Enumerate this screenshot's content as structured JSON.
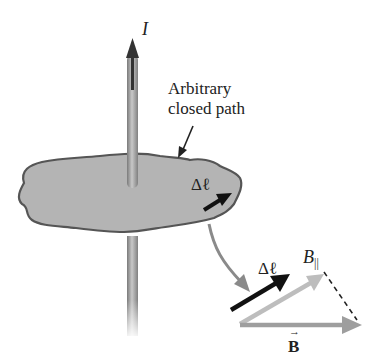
{
  "diagram": {
    "labels": {
      "current": "I",
      "path_line1": "Arbitrary",
      "path_line2": "closed path",
      "dl_on_path": "Δℓ",
      "dl_vector": "Δℓ",
      "b_parallel": "B",
      "b_parallel_sub": "||",
      "b_vector": "B",
      "b_vector_arrow": "→"
    },
    "colors": {
      "background": "#ffffff",
      "surface_fill": "#b4b4b4",
      "surface_outline": "#555555",
      "wire": "#9a9a9a",
      "current_arrow": "#333333",
      "dl_arrow": "#111111",
      "b_parallel_arrow": "#bdbdbd",
      "b_arrow": "#9e9e9e",
      "pointer_arrow": "#8a8a8a"
    }
  }
}
